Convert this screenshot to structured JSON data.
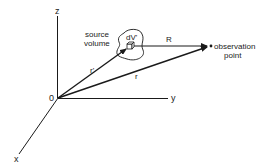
{
  "diagram": {
    "axes": {
      "z_label": "z",
      "y_label": "y",
      "x_label": "x",
      "origin_label": "0"
    },
    "source": {
      "label_line1": "source",
      "label_line2": "volume",
      "element_label": "dV'"
    },
    "vectors": {
      "r_prime_label": "r'",
      "r_label": "r",
      "R_label": "R"
    },
    "observation": {
      "label_line1": "observation",
      "label_line2": "point"
    },
    "colors": {
      "line": "#1a1a1a",
      "text": "#222222",
      "background": "#ffffff"
    }
  }
}
